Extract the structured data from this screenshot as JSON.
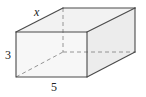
{
  "diagram": {
    "type": "rectangular-prism",
    "labels": {
      "depth": "x",
      "height": "3",
      "width": "5"
    },
    "colors": {
      "edge": "#4a4a4a",
      "hidden_edge": "#8a8a8a",
      "front_face": "#f6f6f6",
      "top_face": "#f0f0f0",
      "side_face": "#ebebeb"
    }
  }
}
